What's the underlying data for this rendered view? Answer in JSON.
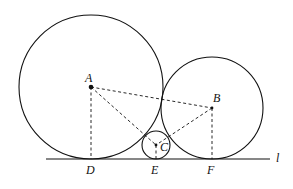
{
  "diagram": {
    "type": "tangent-circles-on-line",
    "line_label": "l",
    "points": {
      "A": {
        "label": "A",
        "x": 91,
        "y": 87
      },
      "B": {
        "label": "B",
        "x": 212,
        "y": 108
      },
      "C": {
        "label": "C",
        "x": 156,
        "y": 145
      },
      "D": {
        "label": "D",
        "x": 91,
        "y": 159
      },
      "E": {
        "label": "E",
        "x": 156,
        "y": 159
      },
      "F": {
        "label": "F",
        "x": 212,
        "y": 159
      }
    },
    "circles": [
      {
        "center": "A",
        "r": 72
      },
      {
        "center": "B",
        "r": 51
      },
      {
        "center": "C",
        "r": 14
      }
    ],
    "dashed_segments": [
      "AB",
      "AC",
      "BC",
      "AD",
      "CE",
      "BF"
    ],
    "colors": {
      "stroke": "#111111",
      "background": "#ffffff"
    }
  }
}
